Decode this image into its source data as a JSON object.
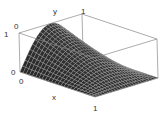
{
  "chart_data": {
    "type": "surface3d",
    "title": "",
    "function": "z = sin(pi*y) * (1 - x)",
    "xlabel": "x",
    "ylabel": "y",
    "zlabel": "",
    "xlim": [
      0,
      1
    ],
    "ylim": [
      0,
      1
    ],
    "zlim": [
      0,
      1
    ],
    "tick_labels": {
      "x": [
        "0",
        "1"
      ],
      "y": [
        "0",
        "1"
      ],
      "z": [
        "0",
        "1"
      ]
    },
    "mesh": 24,
    "surface_color": "#1a1a1a",
    "box": true
  }
}
